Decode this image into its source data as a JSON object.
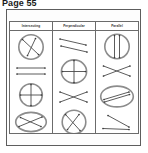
{
  "page": {
    "heading": "Page 55"
  },
  "table": {
    "columns": [
      {
        "id": "intersecting",
        "label": "Intersecting"
      },
      {
        "id": "perpendicular",
        "label": "Perpendicular"
      },
      {
        "id": "parallel",
        "label": "Parallel"
      }
    ],
    "cells": {
      "intersecting": [
        {
          "figure": "circle-with-two-intersecting-lines"
        },
        {
          "figure": "two-parallel-horizontal-lines"
        },
        {
          "figure": "circle-with-perpendicular-cross"
        },
        {
          "figure": "ellipse-with-two-intersecting-lines"
        }
      ],
      "perpendicular": [
        {
          "figure": "two-parallel-diagonal-lines"
        },
        {
          "figure": "circle-with-perpendicular-cross"
        },
        {
          "figure": "two-crossing-lines-x"
        },
        {
          "figure": "circle-with-two-intersecting-lines"
        }
      ],
      "parallel": [
        {
          "figure": "circle-with-two-vertical-parallel-lines"
        },
        {
          "figure": "two-crossing-lines-x"
        },
        {
          "figure": "ellipse-with-two-parallel-diagonal-lines"
        },
        {
          "figure": "two-non-parallel-diagonal-lines"
        }
      ]
    }
  },
  "colors": {
    "page_background": "#ffffff",
    "sheet_background": "#fdfdfd",
    "frame_stroke": "#5d5d5d",
    "table_stroke": "#6b6b6b",
    "shape_outline": "#8c8c8c",
    "line_stroke": "#4a4a4a",
    "heading_text": "#1b1b1b",
    "header_text": "#2a2a2a"
  }
}
